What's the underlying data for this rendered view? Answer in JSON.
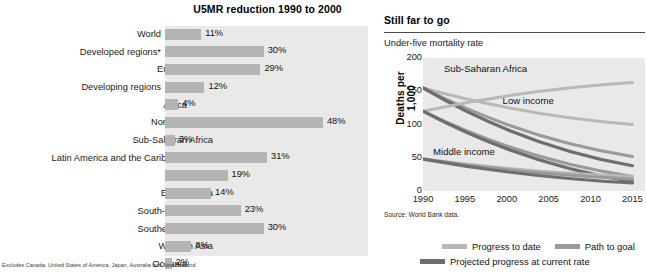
{
  "bar_panel": {
    "title": "U5MR reduction 1990 to 2000",
    "footnote": "Excludes Canada, United States of America, Japan, Australia and New Zealand.",
    "panel_bg": "#e9e9e9",
    "bar_color": "#b4b4b4"
  },
  "line_panel": {
    "title": "Still far to go",
    "subtitle": "Under-five mortality rate",
    "y_axis_title": "Deaths per 1,000",
    "source": "Source: World Bank data.",
    "panel_bg": "#e9e9e9",
    "legend": [
      {
        "label": "Progress to date",
        "color": "#b8b8b8"
      },
      {
        "label": "Path to goal",
        "color": "#9a9a9a"
      },
      {
        "label": "Projected progress at current rate",
        "color": "#6e6e6e"
      }
    ]
  },
  "chart_data": [
    {
      "type": "bar",
      "title": "U5MR reduction 1990 to 2000",
      "xlabel": "",
      "ylabel": "",
      "xlim": [
        0,
        60
      ],
      "grid": false,
      "orientation": "horizontal",
      "value_suffix": "%",
      "categories": [
        "World",
        "Developed regions*",
        "Europe",
        "Developing regions",
        "Africa",
        "Northern Africa",
        "Sub-Saharan Africa",
        "Latin America and the Caribbean",
        "Asia",
        "Eastern Asia",
        "South-central Asia",
        "Southeastern Asia",
        "Western Asia",
        "Oceania"
      ],
      "indent_levels": [
        0,
        0,
        1,
        0,
        1,
        2,
        2,
        1,
        1,
        2,
        2,
        2,
        2,
        1
      ],
      "values": [
        11,
        30,
        29,
        12,
        4,
        48,
        3,
        31,
        19,
        14,
        23,
        30,
        8,
        2
      ],
      "value_labels": [
        "11%",
        "30%",
        "29%",
        "12%",
        "4%",
        "48%",
        "3%",
        "31%",
        "19%",
        "14%",
        "23%",
        "30%",
        "8%",
        "2%"
      ]
    },
    {
      "type": "line",
      "title": "Still far to go",
      "subtitle": "Under-five mortality rate",
      "xlabel": "",
      "ylabel": "Deaths per 1,000",
      "xlim": [
        1990,
        2016.5
      ],
      "ylim": [
        0,
        200
      ],
      "grid": false,
      "x_ticks": [
        1990,
        1995,
        2000,
        2005,
        2010,
        2015
      ],
      "y_ticks": [
        0,
        50,
        100,
        150,
        200
      ],
      "legend_position": "bottom",
      "annotations": [
        {
          "text": "Sub-Saharan Africa",
          "x": 1992.5,
          "y": 183
        },
        {
          "text": "Low income",
          "x": 1999.5,
          "y": 136
        },
        {
          "text": "Middle income",
          "x": 1991.2,
          "y": 58
        }
      ],
      "series": [
        {
          "name": "Sub-Saharan Africa — Progress to date",
          "group": "Sub-Saharan Africa",
          "kind": "progress",
          "color": "#b8b8b8",
          "x": [
            1990,
            2015
          ],
          "values": [
            155,
            100
          ]
        },
        {
          "name": "Sub-Saharan Africa — Path to goal",
          "group": "Sub-Saharan Africa",
          "kind": "path",
          "color": "#9a9a9a",
          "x": [
            1990,
            2015
          ],
          "values": [
            155,
            52
          ]
        },
        {
          "name": "Sub-Saharan Africa — Projected progress at current rate",
          "group": "Sub-Saharan Africa",
          "kind": "projected",
          "color": "#6e6e6e",
          "x": [
            1990,
            2015
          ],
          "values": [
            155,
            38
          ]
        },
        {
          "name": "Low income — Progress to date",
          "group": "Low income",
          "kind": "progress",
          "color": "#b8b8b8",
          "x": [
            1990,
            2015
          ],
          "values": [
            120,
            163
          ]
        },
        {
          "name": "Low income — Path to goal",
          "group": "Low income",
          "kind": "path",
          "color": "#9a9a9a",
          "x": [
            1990,
            2015
          ],
          "values": [
            120,
            22
          ]
        },
        {
          "name": "Low income — Projected progress at current rate",
          "group": "Low income",
          "kind": "projected",
          "color": "#6e6e6e",
          "x": [
            1990,
            2015
          ],
          "values": [
            120,
            14
          ]
        },
        {
          "name": "Middle income — Progress to date",
          "group": "Middle income",
          "kind": "progress",
          "color": "#b8b8b8",
          "x": [
            1990,
            2015
          ],
          "values": [
            48,
            22
          ]
        },
        {
          "name": "Middle income — Path to goal",
          "group": "Middle income",
          "kind": "path",
          "color": "#9a9a9a",
          "x": [
            1990,
            2015
          ],
          "values": [
            48,
            18
          ]
        },
        {
          "name": "Middle income — Projected progress at current rate",
          "group": "Middle income",
          "kind": "projected",
          "color": "#6e6e6e",
          "x": [
            1990,
            2015
          ],
          "values": [
            48,
            12
          ]
        }
      ]
    }
  ]
}
